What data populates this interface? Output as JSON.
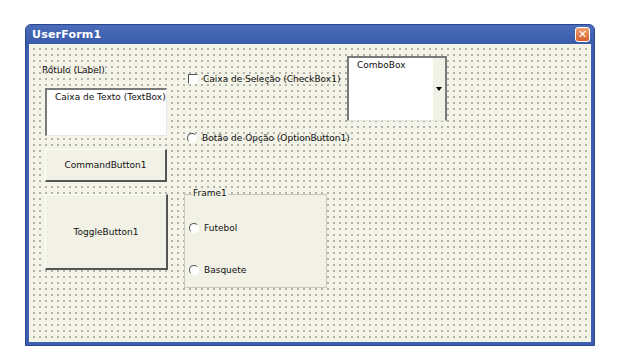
{
  "window": {
    "title": "UserForm1",
    "close_icon": "close-icon",
    "accent": "#3e5fae"
  },
  "controls": {
    "label": "Rótulo (Label)",
    "textbox": "Caixa de Texto (TextBox)",
    "command_button": "CommandButton1",
    "toggle_button": "ToggleButton1",
    "checkbox": "Caixa de Seleção (CheckBox1)",
    "option_button": "Botão de Opção (OptionButton1)",
    "combobox": "ComboBox",
    "frame": {
      "caption": "Frame1",
      "options": [
        "Futebol",
        "Basquete"
      ]
    }
  }
}
